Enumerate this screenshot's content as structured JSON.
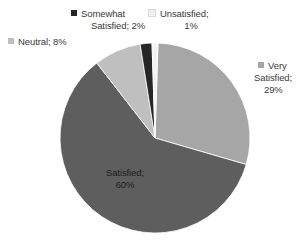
{
  "chart_data": {
    "type": "pie",
    "title": "",
    "subtitle": "",
    "xlabel": "",
    "ylabel": "",
    "grid": false,
    "legend_position": "callout-labels",
    "label_format": "name; percent",
    "background_color": "#FFFFFF",
    "center": {
      "x": 155,
      "y": 138
    },
    "radius": 95,
    "start_angle_deg": -88.2,
    "categories": [
      "Very Satisfied",
      "Satisfied",
      "Neutral",
      "Somewhat Satisfied",
      "Unsatisfied"
    ],
    "values": [
      29,
      60,
      8,
      2,
      1
    ],
    "units": "%",
    "colors": [
      "#A6A6A6",
      "#5E5E5E",
      "#BFBFBF",
      "#262626",
      "#F2F2F2"
    ],
    "slices": [
      {
        "name": "Very Satisfied",
        "value": 29,
        "percent_text": "29%",
        "color": "#A6A6A6",
        "sweep_deg": 104.4,
        "label_line_1": "Very",
        "label_line_2": "Satisfied;",
        "label_line_3": "29%",
        "label_placement": "outside-right"
      },
      {
        "name": "Satisfied",
        "value": 60,
        "percent_text": "60%",
        "color": "#5E5E5E",
        "sweep_deg": 216.0,
        "label_line_1": "Satisfied;",
        "label_line_2": "60%",
        "label_placement": "inside"
      },
      {
        "name": "Neutral",
        "value": 8,
        "percent_text": "8%",
        "color": "#BFBFBF",
        "sweep_deg": 28.8,
        "label_line_1": "Neutral; 8%",
        "label_placement": "outside-upper-left"
      },
      {
        "name": "Somewhat Satisfied",
        "value": 2,
        "percent_text": "2%",
        "color": "#262626",
        "sweep_deg": 7.2,
        "label_line_1": "Somewhat",
        "label_line_2": "Satisfied; 2%",
        "label_placement": "outside-top"
      },
      {
        "name": "Unsatisfied",
        "value": 1,
        "percent_text": "1%",
        "color": "#F2F2F2",
        "sweep_deg": 3.6,
        "label_line_1": "Unsatisfied;",
        "label_line_2": "1%",
        "label_placement": "outside-top-right"
      }
    ]
  },
  "labels": {
    "neutral": {
      "text": "Neutral; 8%",
      "swatch_color": "#BFBFBF"
    },
    "somewhat_satisfied": {
      "line1": "Somewhat",
      "line2": "Satisfied; 2%",
      "swatch_color": "#262626"
    },
    "unsatisfied": {
      "line1": "Unsatisfied;",
      "line2": "1%",
      "swatch_color": "#F2F2F2"
    },
    "very_satisfied": {
      "line1": "Very",
      "line2": "Satisfied;",
      "line3": "29%",
      "swatch_color": "#A6A6A6"
    },
    "satisfied": {
      "line1": "Satisfied;",
      "line2": "60%"
    }
  }
}
